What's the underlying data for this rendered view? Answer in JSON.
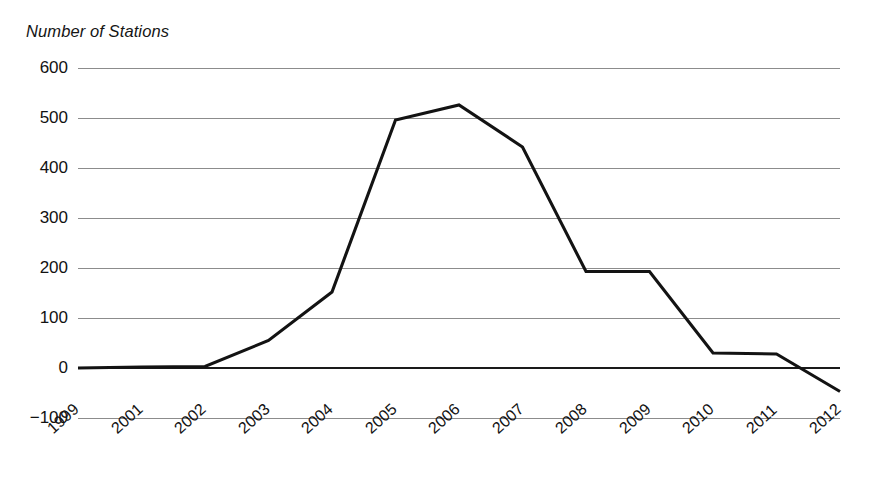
{
  "chart_data": {
    "type": "line",
    "title": "Number of Stations",
    "subtitle": "",
    "xlabel": "",
    "ylabel": "Number of Stations",
    "categories": [
      "1999",
      "2001",
      "2002",
      "2003",
      "2004",
      "2005",
      "2006",
      "2007",
      "2008",
      "2009",
      "2010",
      "2011",
      "2012"
    ],
    "values": [
      0,
      2,
      3,
      55,
      152,
      496,
      526,
      442,
      193,
      193,
      30,
      28,
      -47
    ],
    "series": [
      {
        "name": "Number of Stations",
        "values": [
          0,
          2,
          3,
          55,
          152,
          496,
          526,
          442,
          193,
          193,
          30,
          28,
          -47
        ]
      }
    ],
    "ylim": [
      -100,
      600
    ],
    "yticks": [
      600,
      500,
      400,
      300,
      200,
      100,
      0,
      -100
    ],
    "ytick_labels": [
      "600",
      "500",
      "400",
      "300",
      "200",
      "100",
      "0",
      "−100"
    ],
    "grid": "horizontal",
    "legend": "none",
    "line_color": "#131313",
    "grid_color": "#8c8c8c",
    "zero_line_color": "#1a1a1a",
    "background_color": "#ffffff",
    "xtick_rotation_degrees": -42,
    "markers": false,
    "annotations": []
  },
  "axis": {
    "y_title": "Number of Stations",
    "x_label_0": "1999",
    "x_label_1": "2001",
    "x_label_2": "2002",
    "x_label_3": "2003",
    "x_label_4": "2004",
    "x_label_5": "2005",
    "x_label_6": "2006",
    "x_label_7": "2007",
    "x_label_8": "2008",
    "x_label_9": "2009",
    "x_label_10": "2010",
    "x_label_11": "2011",
    "x_label_12": "2012"
  }
}
